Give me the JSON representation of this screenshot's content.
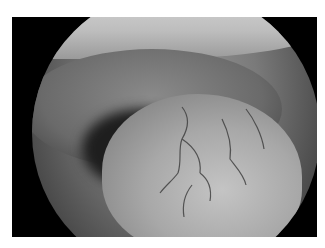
{
  "image": {
    "description": "Grayscale endoscopic photograph showing a rounded smooth mass with branching surface vessels beneath a mucosal fold, inside circular scope field on black frame",
    "colors": {
      "background": "#ffffff",
      "frame": "#000000"
    }
  }
}
